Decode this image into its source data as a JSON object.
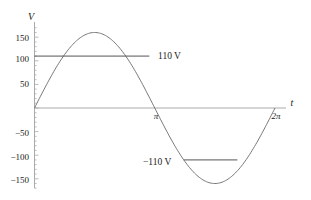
{
  "chart_data": {
    "type": "line",
    "title": "",
    "xlabel": "t",
    "ylabel": "V",
    "xlim": [
      0,
      6.2832
    ],
    "ylim": [
      -170,
      170
    ],
    "grid": false,
    "legend": "none",
    "x_ticks": [
      {
        "value": 3.1416,
        "label": "π"
      },
      {
        "value": 6.2832,
        "label": "2π"
      }
    ],
    "y_ticks": [
      {
        "value": 150,
        "label": "150"
      },
      {
        "value": 100,
        "label": "100"
      },
      {
        "value": 50,
        "label": "50"
      },
      {
        "value": -50,
        "label": "-50"
      },
      {
        "value": -100,
        "label": "-100"
      },
      {
        "value": -150,
        "label": "-150"
      }
    ],
    "series": [
      {
        "name": "V(t) = 160 sin(t)",
        "function": "160*sin(t)",
        "amplitude": 160,
        "x": [
          0,
          0.7854,
          1.5708,
          2.3562,
          3.1416,
          3.927,
          4.7124,
          5.4978,
          6.2832
        ],
        "values": [
          0,
          113,
          160,
          113,
          0,
          -113,
          -160,
          -113,
          0
        ],
        "color": "#777777"
      }
    ],
    "annotations": [
      {
        "type": "hline",
        "y": 110,
        "x_start": 0,
        "x_end": 3.0,
        "label": "110  V",
        "color": "#555555"
      },
      {
        "type": "hline",
        "y": -110,
        "x_start": 3.9,
        "x_end": 5.3,
        "label": "−110 V",
        "color": "#555555"
      }
    ]
  },
  "labels": {
    "y_axis": "V",
    "x_axis": "t",
    "pi": "π",
    "two_pi": "2π",
    "pos_110": "110  V",
    "neg_110": "−110 V",
    "y150": "150",
    "y100": "100",
    "y50": "50",
    "ym50": "−50",
    "ym100": "−100",
    "ym150": "−150"
  }
}
